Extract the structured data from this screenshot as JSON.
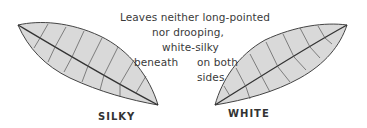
{
  "caption": {
    "line1": "Leaves neither long-pointed",
    "line2": "nor drooping,",
    "line3": "white-silky",
    "left_note": "beneath",
    "right_note_1": "on both",
    "right_note_2": "sides"
  },
  "leaves": [
    {
      "label": "SILKY",
      "fill": "#d9d9d9",
      "stroke": "#444444"
    },
    {
      "label": "WHITE",
      "fill": "#d9d9d9",
      "stroke": "#444444"
    }
  ]
}
